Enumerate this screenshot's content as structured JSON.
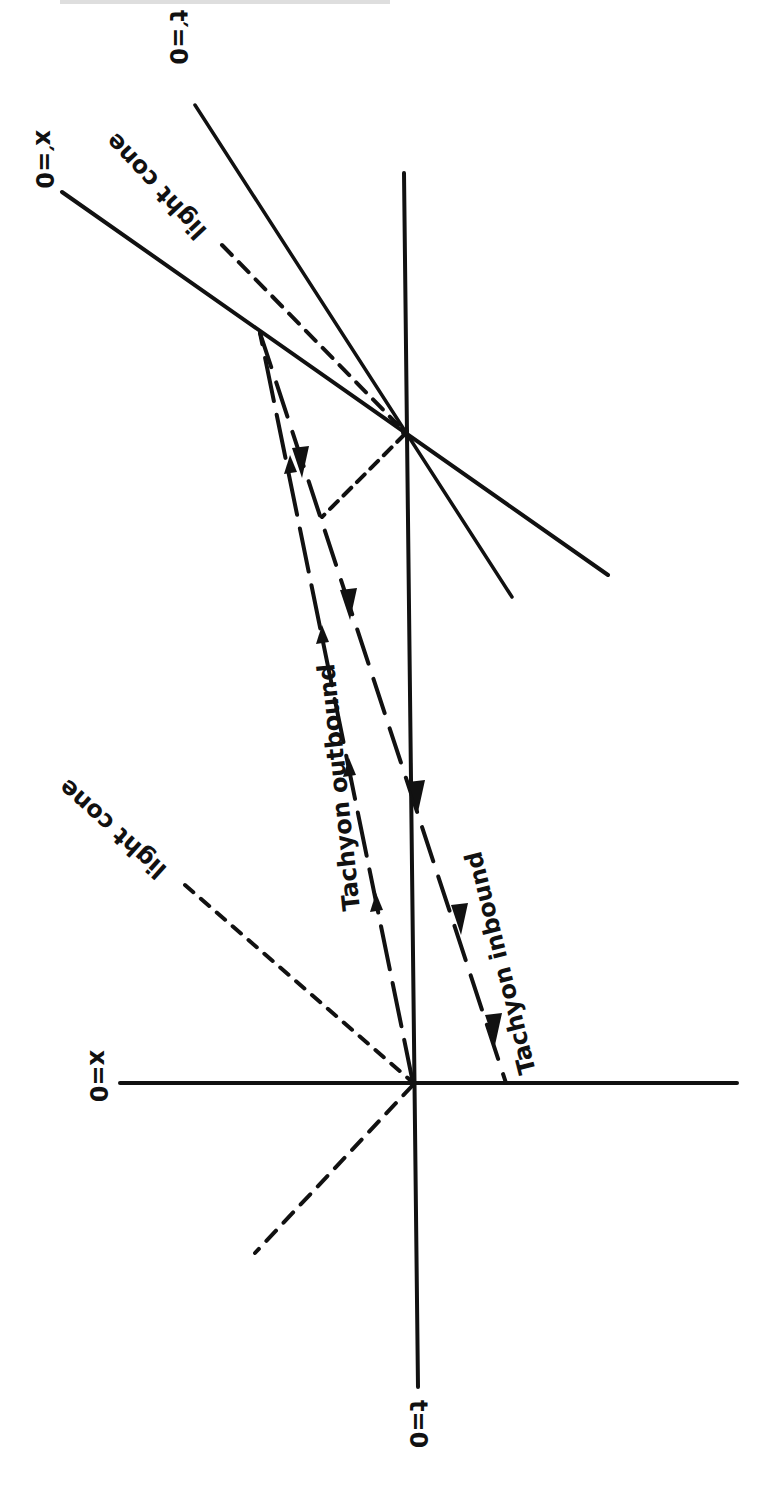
{
  "figure": {
    "type": "spacetime-diagram",
    "orientation": "rotated 90deg (page turned)",
    "colors": {
      "ink": "#111111",
      "background": "#ffffff"
    },
    "labels": {
      "t_axis": "t=0",
      "x_axis": "x=0",
      "t_prime_axis": "t′=0",
      "x_prime_axis": "x′=0",
      "light_cone_upper": "light cone",
      "light_cone_lower": "light cone",
      "tachyon_outbound": "Tachyon outbound",
      "tachyon_inbound": "Tachyon inbound"
    },
    "lines": [
      {
        "name": "t-axis",
        "style": "solid",
        "from": [
          404,
          173
        ],
        "to": [
          418,
          1387
        ]
      },
      {
        "name": "x-axis",
        "style": "solid",
        "from": [
          120,
          1083
        ],
        "to": [
          737,
          1083
        ]
      },
      {
        "name": "x-prime-axis",
        "style": "solid",
        "from": [
          62,
          192
        ],
        "to": [
          608,
          575
        ]
      },
      {
        "name": "t-prime-axis",
        "style": "solid",
        "from": [
          195,
          105
        ],
        "to": [
          512,
          597
        ]
      },
      {
        "name": "light-cone-upper",
        "style": "dashed",
        "from": [
          222,
          245
        ],
        "to": [
          398,
          425
        ]
      },
      {
        "name": "light-cone-lower",
        "style": "dashed",
        "from": [
          185,
          885
        ],
        "to": [
          255,
          1253
        ]
      },
      {
        "name": "tachyon-outbound",
        "style": "long-dash",
        "from": [
          413,
          1083
        ],
        "to": [
          260,
          333
        ]
      },
      {
        "name": "tachyon-inbound",
        "style": "long-dash",
        "from": [
          260,
          333
        ],
        "to": [
          506,
          1083
        ]
      },
      {
        "name": "signal-link",
        "style": "dashed",
        "from": [
          405,
          432
        ],
        "to": [
          322,
          517
        ]
      }
    ],
    "points": {
      "origin": [
        413,
        1083
      ],
      "event": [
        405,
        432
      ],
      "turning_point": [
        260,
        333
      ]
    }
  }
}
